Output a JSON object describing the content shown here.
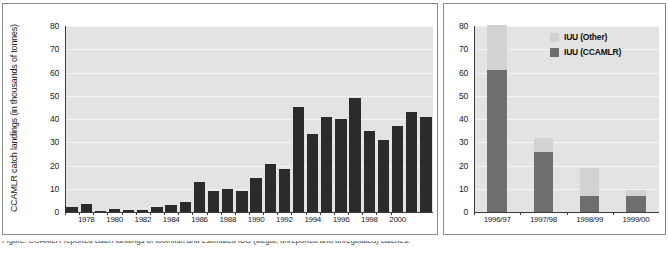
{
  "figure": {
    "caption": "Figure: CCAMLR reported catch landings of toothfish and estimated IUU (illegal, unreported and unregulated) catches."
  },
  "left_panel": {
    "ylabel": "CCAMLR catch landings (in thousands of tonnes)",
    "yticks": [
      "0",
      "10",
      "20",
      "30",
      "40",
      "50",
      "60",
      "70",
      "80"
    ],
    "xticks": [
      "1978",
      "1980",
      "1982",
      "1984",
      "1986",
      "1988",
      "1990",
      "1992",
      "1994",
      "1996",
      "1998",
      "2000"
    ]
  },
  "right_panel": {
    "yticks": [
      "0",
      "10",
      "20",
      "30",
      "40",
      "50",
      "60",
      "70",
      "80"
    ],
    "xticks": [
      "1996/97",
      "1997/98",
      "1998/99",
      "1999/00"
    ],
    "legend": [
      {
        "label": "IUU (Other)",
        "color": "#d2d2d2"
      },
      {
        "label": "IUU (CCAMLR)",
        "color": "#6e6e6e"
      }
    ]
  },
  "chart_data": [
    {
      "type": "bar",
      "panel": "left",
      "title": "",
      "xlabel": "",
      "ylabel": "CCAMLR catch landings (in thousands of tonnes)",
      "ylim": [
        0,
        80
      ],
      "grid": true,
      "bar_color": "#2b2b2b",
      "categories": [
        "1977",
        "1978",
        "1979",
        "1980",
        "1981",
        "1982",
        "1983",
        "1984",
        "1985",
        "1986",
        "1987",
        "1988",
        "1989",
        "1990",
        "1991",
        "1992",
        "1993",
        "1994",
        "1995",
        "1996",
        "1997",
        "1998",
        "1999",
        "2000"
      ],
      "values": [
        2,
        3.5,
        0.5,
        1.5,
        1,
        1,
        2,
        3,
        4.5,
        13,
        9,
        10,
        9,
        14.5,
        20.5,
        18.5,
        45,
        33.5,
        41,
        40,
        49,
        35,
        31,
        37,
        43,
        41
      ]
    },
    {
      "type": "bar",
      "panel": "right",
      "stacked": true,
      "title": "",
      "xlabel": "",
      "ylabel": "",
      "ylim": [
        0,
        80
      ],
      "grid": true,
      "legend_position": "top-right",
      "categories": [
        "1996/97",
        "1997/98",
        "1998/99",
        "1999/00"
      ],
      "series": [
        {
          "name": "IUU (CCAMLR)",
          "color": "#6e6e6e",
          "values": [
            61,
            26,
            7,
            7
          ]
        },
        {
          "name": "IUU (Other)",
          "color": "#d2d2d2",
          "values": [
            19.5,
            6,
            12,
            2.5
          ]
        }
      ],
      "totals": [
        80.5,
        32,
        19,
        9.5
      ]
    }
  ]
}
